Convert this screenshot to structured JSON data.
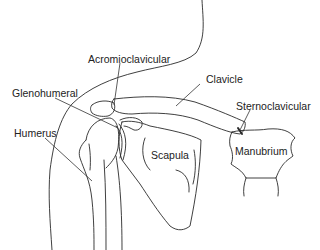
{
  "diagram": {
    "background": "#ffffff",
    "line_color": "#2a2a2a",
    "labels": [
      {
        "id": "acromioclavicular",
        "text": "Acromioclavicular",
        "x": 88,
        "y": 54
      },
      {
        "id": "clavicle",
        "text": "Clavicle",
        "x": 206,
        "y": 74
      },
      {
        "id": "glenohumeral",
        "text": "Glenohumeral",
        "x": 12,
        "y": 88
      },
      {
        "id": "sternoclavicular",
        "text": "Sternoclavicular",
        "x": 236,
        "y": 101
      },
      {
        "id": "humerus",
        "text": "Humerus",
        "x": 14,
        "y": 128
      },
      {
        "id": "scapula",
        "text": "Scapula",
        "x": 151,
        "y": 150
      },
      {
        "id": "manubrium",
        "text": "Manubrium",
        "x": 235,
        "y": 146
      }
    ]
  }
}
